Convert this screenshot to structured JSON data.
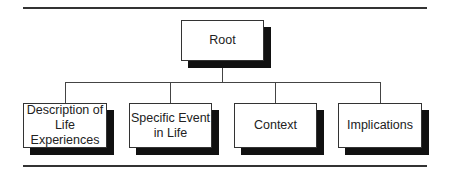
{
  "diagram": {
    "type": "hierarchy",
    "root": {
      "label": "Root"
    },
    "children": [
      {
        "label": "Description of\nLife\nExperiences"
      },
      {
        "label": "Specific Event\nin Life"
      },
      {
        "label": "Context"
      },
      {
        "label": "Implications"
      }
    ],
    "colors": {
      "line": "#444444",
      "shadow": "#111111",
      "box_fill": "#ffffff",
      "box_border": "#333333"
    }
  }
}
